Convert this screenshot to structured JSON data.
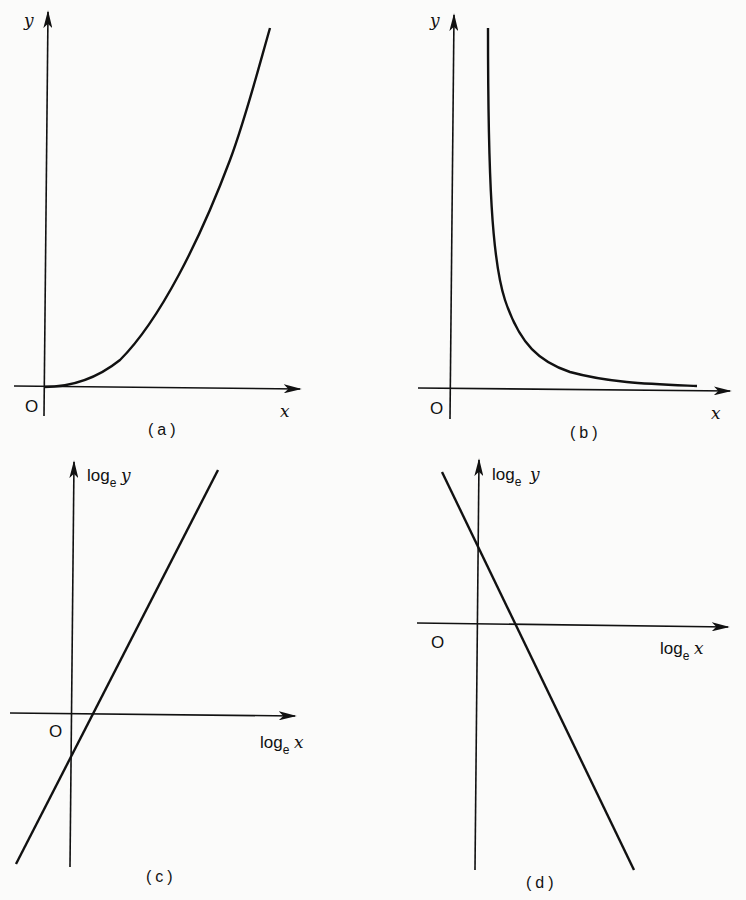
{
  "panels": [
    {
      "id": "a",
      "caption": "(a)",
      "y_label": "y",
      "x_label": "x",
      "origin_label": "O",
      "curve": "power curve rising from origin, concave up"
    },
    {
      "id": "b",
      "caption": "(b)",
      "y_label": "y",
      "x_label": "x",
      "origin_label": "O",
      "curve": "hyperbolic decay approaching x-axis"
    },
    {
      "id": "c",
      "caption": "(c)",
      "y_label_base": "log",
      "y_label_sub": "e",
      "y_label_var": "y",
      "x_label_base": "log",
      "x_label_sub": "e",
      "x_label_var": "x",
      "origin_label": "O",
      "curve": "straight line with positive slope, negative intercept"
    },
    {
      "id": "d",
      "caption": "(d)",
      "y_label_base": "log",
      "y_label_sub": "e",
      "y_label_var": "y",
      "x_label_base": "log",
      "x_label_sub": "e",
      "x_label_var": "x",
      "origin_label": "O",
      "curve": "straight line with negative slope, positive intercept"
    }
  ],
  "caption_fragment": ""
}
